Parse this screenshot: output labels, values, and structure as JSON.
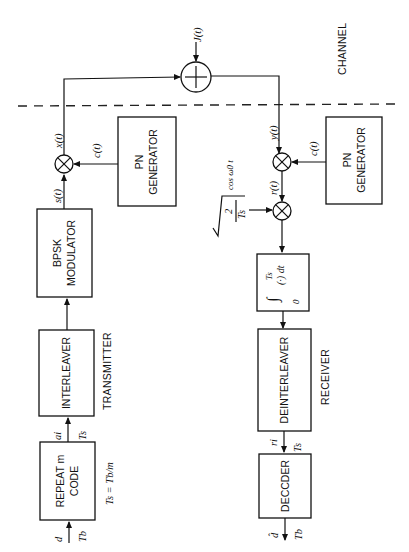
{
  "diagram": {
    "orientation": "rotated 90 degrees counter-clockwise",
    "sections": {
      "channel": "CHANNEL",
      "transmitter": "TRANSMITTER",
      "receiver": "RECEIVER"
    },
    "transmitter": {
      "repeat_code": {
        "line1": "REPEAT m",
        "line2": "CODE"
      },
      "interleaver": "INTERLEAVER",
      "modulator": {
        "line1": "BPSK",
        "line2": "MODULATOR"
      },
      "pn_generator": {
        "line1": "PN",
        "line2": "GENERATOR"
      }
    },
    "receiver": {
      "pn_generator": {
        "line1": "PN",
        "line2": "GENERATOR"
      },
      "integrator": {
        "upper": "Ts",
        "lower": "0",
        "body": "(·) dt"
      },
      "deinterleaver": "DEINTERLEAVER",
      "decoder": "DECCDER"
    },
    "signals": {
      "d": "d",
      "Tb_in": "Tb",
      "Ts_relation": "Ts = Tb/m",
      "ai": "ai",
      "Ts_tx": "Ts",
      "s_t": "s(t)",
      "x_t": "x(t)",
      "c_t_tx": "c(t)",
      "J_t": "J(t)",
      "y_t": "y(t)",
      "c_t_rx": "c(t)",
      "r_t": "r(t)",
      "carrier": "√(2/Ts) cos ω0 t",
      "carrier_num": "2",
      "carrier_den": "Ts",
      "carrier_cos": "cos ω0 t",
      "ri": "ri",
      "Ts_rx": "Ts",
      "d_hat": "d̂",
      "Tb_out": "Tb"
    },
    "symbols": {
      "adder": "+",
      "multiplier": "×"
    }
  }
}
